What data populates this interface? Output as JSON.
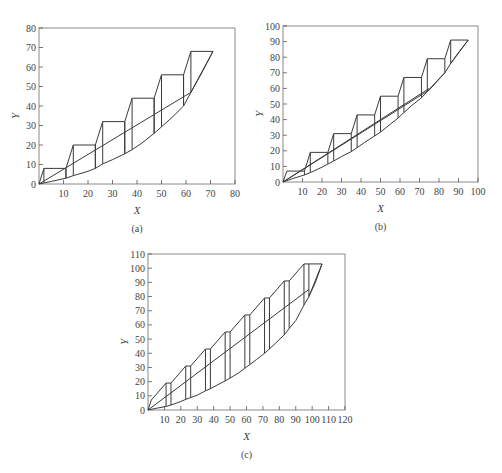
{
  "chart_data": [
    {
      "type": "line",
      "panel_label": "(a)",
      "xlabel": "X",
      "ylabel": "Y",
      "xlim": [
        0,
        80
      ],
      "ylim": [
        0,
        80
      ],
      "xticks": [
        10,
        20,
        30,
        40,
        50,
        60,
        70,
        80
      ],
      "yticks": [
        0,
        10,
        20,
        30,
        40,
        50,
        60,
        70,
        80
      ],
      "grid": false,
      "frame": {
        "left": 39,
        "top": 28,
        "right": 235,
        "bottom": 184
      },
      "series": [
        {
          "name": "staircase",
          "points": [
            [
              0,
              0
            ],
            [
              2,
              8
            ],
            [
              11,
              8
            ],
            [
              11,
              3
            ],
            [
              11,
              8
            ],
            [
              14,
              20
            ],
            [
              23,
              20
            ],
            [
              23,
              8
            ],
            [
              23,
              20
            ],
            [
              26,
              32
            ],
            [
              35,
              32
            ],
            [
              35,
              15.5
            ],
            [
              35,
              32
            ],
            [
              38,
              44
            ],
            [
              47,
              44
            ],
            [
              47,
              26
            ],
            [
              47,
              44
            ],
            [
              50,
              56
            ],
            [
              59,
              56
            ],
            [
              59,
              40
            ],
            [
              59,
              56
            ],
            [
              62,
              68
            ],
            [
              71,
              68
            ],
            [
              62,
              47
            ]
          ]
        },
        {
          "name": "step-verticals",
          "segments": [
            [
              [
                2,
                8
              ],
              [
                2,
                0.6
              ]
            ],
            [
              [
                14,
                20
              ],
              [
                14,
                4.3
              ]
            ],
            [
              [
                26,
                32
              ],
              [
                26,
                10.3
              ]
            ],
            [
              [
                38,
                44
              ],
              [
                38,
                17.6
              ]
            ],
            [
              [
                50,
                56
              ],
              [
                50,
                29.3
              ]
            ],
            [
              [
                62,
                68
              ],
              [
                62,
                47
              ]
            ]
          ]
        },
        {
          "name": "lower-curve",
          "points": [
            [
              0,
              0
            ],
            [
              5,
              1.3
            ],
            [
              11,
              3
            ],
            [
              14,
              4.3
            ],
            [
              20,
              6.5
            ],
            [
              23,
              8
            ],
            [
              26,
              10.3
            ],
            [
              30,
              12.5
            ],
            [
              35,
              15.5
            ],
            [
              38,
              17.6
            ],
            [
              42,
              21
            ],
            [
              47,
              26
            ],
            [
              50,
              29.3
            ],
            [
              55,
              35
            ],
            [
              59,
              40
            ],
            [
              62,
              47
            ],
            [
              66,
              56
            ],
            [
              71,
              68
            ]
          ]
        },
        {
          "name": "operating-line",
          "points": [
            [
              0,
              0
            ],
            [
              62,
              47
            ]
          ]
        }
      ]
    },
    {
      "type": "line",
      "panel_label": "(b)",
      "xlabel": "X",
      "ylabel": "Y",
      "xlim": [
        0,
        100
      ],
      "ylim": [
        0,
        100
      ],
      "xticks": [
        10,
        20,
        30,
        40,
        50,
        60,
        70,
        80,
        90,
        100
      ],
      "yticks": [
        0,
        10,
        20,
        30,
        40,
        50,
        60,
        70,
        80,
        90,
        100
      ],
      "grid": false,
      "frame": {
        "left": 283,
        "top": 26,
        "right": 478,
        "bottom": 182
      },
      "series": [
        {
          "name": "staircase",
          "points": [
            [
              0,
              0
            ],
            [
              2,
              7
            ],
            [
              11,
              7
            ],
            [
              14,
              19
            ],
            [
              23,
              19
            ],
            [
              26,
              31
            ],
            [
              35,
              31
            ],
            [
              38,
              43
            ],
            [
              47,
              43
            ],
            [
              50,
              55
            ],
            [
              59,
              55
            ],
            [
              62,
              67
            ],
            [
              71,
              67
            ],
            [
              74,
              79
            ],
            [
              83,
              79
            ],
            [
              86,
              91
            ],
            [
              95,
              91
            ],
            [
              86,
              76
            ]
          ]
        },
        {
          "name": "step-verticals",
          "segments": [
            [
              [
                11,
                7
              ],
              [
                11,
                4.5
              ]
            ],
            [
              [
                14,
                19
              ],
              [
                14,
                6
              ]
            ],
            [
              [
                23,
                19
              ],
              [
                23,
                11.5
              ]
            ],
            [
              [
                26,
                31
              ],
              [
                26,
                13.5
              ]
            ],
            [
              [
                35,
                31
              ],
              [
                35,
                19.5
              ]
            ],
            [
              [
                38,
                43
              ],
              [
                38,
                22
              ]
            ],
            [
              [
                47,
                43
              ],
              [
                47,
                29.5
              ]
            ],
            [
              [
                50,
                55
              ],
              [
                50,
                32
              ]
            ],
            [
              [
                59,
                55
              ],
              [
                59,
                41
              ]
            ],
            [
              [
                62,
                67
              ],
              [
                62,
                44.5
              ]
            ],
            [
              [
                71,
                67
              ],
              [
                71,
                54
              ]
            ],
            [
              [
                74,
                79
              ],
              [
                74,
                58
              ]
            ],
            [
              [
                83,
                79
              ],
              [
                83,
                70
              ]
            ],
            [
              [
                86,
                91
              ],
              [
                86,
                76
              ]
            ]
          ]
        },
        {
          "name": "lower-curve",
          "points": [
            [
              0,
              0
            ],
            [
              5,
              2.2
            ],
            [
              11,
              4.5
            ],
            [
              14,
              6
            ],
            [
              20,
              9.5
            ],
            [
              23,
              11.5
            ],
            [
              26,
              13.5
            ],
            [
              30,
              16.3
            ],
            [
              35,
              19.5
            ],
            [
              38,
              22
            ],
            [
              42,
              25.5
            ],
            [
              47,
              29.5
            ],
            [
              50,
              32
            ],
            [
              55,
              37
            ],
            [
              59,
              41
            ],
            [
              62,
              44.5
            ],
            [
              66,
              49
            ],
            [
              71,
              54
            ],
            [
              74,
              58
            ],
            [
              78,
              63.5
            ],
            [
              83,
              70
            ],
            [
              86,
              76
            ],
            [
              90,
              83
            ],
            [
              95,
              91
            ]
          ]
        },
        {
          "name": "operating-line",
          "points": [
            [
              0,
              0
            ],
            [
              75,
              60
            ]
          ]
        },
        {
          "name": "operating-line-2",
          "points": [
            [
              0,
              0
            ],
            [
              75,
              59
            ],
            [
              83,
              70
            ]
          ]
        }
      ]
    },
    {
      "type": "line",
      "panel_label": "(c)",
      "xlabel": "X",
      "ylabel": "Y",
      "xlim": [
        0,
        120
      ],
      "ylim": [
        0,
        110
      ],
      "xticks": [
        10,
        20,
        30,
        40,
        50,
        60,
        70,
        80,
        90,
        100,
        110,
        120
      ],
      "yticks": [
        0,
        10,
        20,
        30,
        40,
        50,
        60,
        70,
        80,
        90,
        100,
        110
      ],
      "grid": false,
      "frame": {
        "left": 148,
        "top": 254,
        "right": 345,
        "bottom": 410
      },
      "series": [
        {
          "name": "upper-envelope",
          "points": [
            [
              0,
              0
            ],
            [
              2,
              7
            ],
            [
              11,
              19
            ],
            [
              14,
              19
            ],
            [
              23,
              31
            ],
            [
              26,
              31
            ],
            [
              35,
              43
            ],
            [
              38,
              43
            ],
            [
              47,
              55
            ],
            [
              50,
              55
            ],
            [
              59,
              67
            ],
            [
              62,
              67
            ],
            [
              71,
              79
            ],
            [
              74,
              79
            ],
            [
              83,
              91
            ],
            [
              86,
              91
            ],
            [
              95,
              103
            ],
            [
              106,
              103
            ],
            [
              98,
              80
            ]
          ]
        },
        {
          "name": "step-verticals",
          "segments": [
            [
              [
                11,
                19
              ],
              [
                11,
                2.5
              ]
            ],
            [
              [
                14,
                19
              ],
              [
                14,
                3.5
              ]
            ],
            [
              [
                23,
                31
              ],
              [
                23,
                7.5
              ]
            ],
            [
              [
                26,
                31
              ],
              [
                26,
                8.8
              ]
            ],
            [
              [
                35,
                43
              ],
              [
                35,
                13.5
              ]
            ],
            [
              [
                38,
                43
              ],
              [
                38,
                15
              ]
            ],
            [
              [
                47,
                55
              ],
              [
                47,
                20.5
              ]
            ],
            [
              [
                50,
                55
              ],
              [
                50,
                22.5
              ]
            ],
            [
              [
                59,
                67
              ],
              [
                59,
                29.5
              ]
            ],
            [
              [
                62,
                67
              ],
              [
                62,
                32
              ]
            ],
            [
              [
                71,
                79
              ],
              [
                71,
                40
              ]
            ],
            [
              [
                74,
                79
              ],
              [
                74,
                43
              ]
            ],
            [
              [
                83,
                91
              ],
              [
                83,
                53
              ]
            ],
            [
              [
                86,
                91
              ],
              [
                86,
                57.5
              ]
            ],
            [
              [
                95,
                103
              ],
              [
                95,
                74
              ]
            ],
            [
              [
                98,
                103
              ],
              [
                98,
                80
              ]
            ]
          ]
        },
        {
          "name": "lower-curve",
          "points": [
            [
              0,
              0
            ],
            [
              5,
              1.2
            ],
            [
              11,
              2.5
            ],
            [
              14,
              3.5
            ],
            [
              20,
              6
            ],
            [
              23,
              7.5
            ],
            [
              26,
              8.8
            ],
            [
              30,
              10.5
            ],
            [
              35,
              13.5
            ],
            [
              38,
              15
            ],
            [
              42,
              17.5
            ],
            [
              47,
              20.5
            ],
            [
              50,
              22.5
            ],
            [
              55,
              26
            ],
            [
              59,
              29.5
            ],
            [
              62,
              32
            ],
            [
              66,
              35.5
            ],
            [
              71,
              40
            ],
            [
              74,
              43
            ],
            [
              78,
              47.5
            ],
            [
              83,
              53
            ],
            [
              86,
              57.5
            ],
            [
              90,
              63
            ],
            [
              95,
              74
            ],
            [
              98,
              80
            ],
            [
              102,
              90
            ],
            [
              106,
              103
            ]
          ]
        },
        {
          "name": "operating-line",
          "points": [
            [
              0,
              0
            ],
            [
              98,
              85
            ]
          ]
        }
      ]
    }
  ]
}
